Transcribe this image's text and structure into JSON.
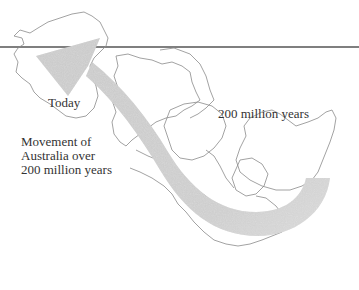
{
  "diagram": {
    "labels": {
      "today": "Today",
      "past": "200 million years",
      "caption_lines": [
        "Movement of",
        "Australia over",
        "200 million years"
      ]
    },
    "arrow": {
      "direction": "from south-east (200 million years ago) to north-west (today)",
      "color": "#c8c8c8"
    },
    "colors": {
      "outline": "#8a8a8a",
      "rule_line": "#555555",
      "text": "#333333",
      "background": "#ffffff"
    }
  }
}
